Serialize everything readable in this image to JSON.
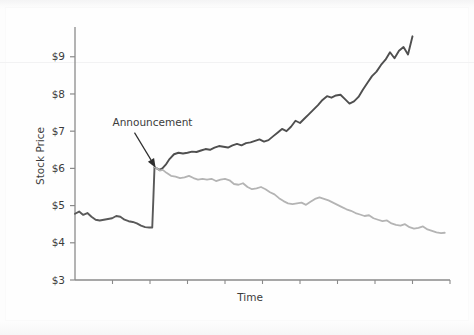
{
  "chart_data": {
    "type": "line",
    "title": "",
    "xlabel": "Time",
    "ylabel": "Stock Price",
    "ylim": [
      3,
      9.8
    ],
    "yticks": [
      3,
      4,
      5,
      6,
      7,
      8,
      9
    ],
    "ytick_labels": [
      "$3",
      "$4",
      "$5",
      "$6",
      "$7",
      "$8",
      "$9"
    ],
    "xlim": [
      0,
      100
    ],
    "xticks": [
      0,
      10,
      20,
      30,
      40,
      50,
      60,
      70,
      80,
      90,
      100
    ],
    "xtick_labels": [
      "",
      "",
      "",
      "",
      "",
      "",
      "",
      "",
      "",
      "",
      ""
    ],
    "grid": false,
    "legend": "none",
    "annotations": [
      {
        "label": "Announcement",
        "text_x": 10.0,
        "text_y": 7.15,
        "point_x": 21.5,
        "point_y": 6.02
      }
    ],
    "series": [
      {
        "name": "pre-announcement",
        "color": "#595959",
        "width": 1.9,
        "x": [
          0.0,
          1.1,
          2.2,
          3.3,
          4.4,
          5.5,
          6.6,
          7.7,
          8.8,
          9.9,
          11.0,
          12.1,
          13.2,
          14.3,
          15.4,
          16.5,
          17.6,
          18.7,
          19.8,
          20.6,
          20.9,
          21.2
        ],
        "y": [
          4.78,
          4.84,
          4.75,
          4.8,
          4.7,
          4.62,
          4.6,
          4.62,
          4.64,
          4.66,
          4.72,
          4.7,
          4.62,
          4.58,
          4.56,
          4.52,
          4.46,
          4.42,
          4.41,
          4.41,
          5.2,
          6.03
        ]
      },
      {
        "name": "upward-post-announcement",
        "color": "#4f4f4f",
        "width": 1.9,
        "x": [
          21.2,
          21.8,
          22.5,
          23.3,
          24.2,
          25.2,
          26.4,
          27.6,
          28.8,
          30.0,
          31.2,
          32.4,
          33.6,
          34.8,
          36.0,
          37.2,
          38.4,
          39.6,
          40.8,
          42.0,
          43.2,
          44.4,
          45.6,
          46.8,
          48.0,
          49.2,
          50.4,
          51.6,
          52.8,
          54.0,
          55.2,
          56.4,
          57.6,
          58.8,
          60.0,
          61.2,
          62.4,
          63.6,
          64.8,
          66.0,
          67.2,
          68.4,
          69.6,
          70.8,
          72.0,
          73.2,
          74.4,
          75.6,
          76.8,
          78.0,
          79.2,
          80.4,
          81.6,
          82.8,
          84.0,
          85.2,
          86.4,
          87.6,
          88.8,
          90.0
        ],
        "y": [
          6.03,
          6.0,
          5.96,
          6.0,
          6.1,
          6.25,
          6.38,
          6.42,
          6.4,
          6.42,
          6.45,
          6.44,
          6.48,
          6.52,
          6.5,
          6.56,
          6.6,
          6.58,
          6.56,
          6.62,
          6.66,
          6.62,
          6.68,
          6.7,
          6.74,
          6.78,
          6.72,
          6.76,
          6.86,
          6.96,
          7.06,
          7.0,
          7.12,
          7.28,
          7.22,
          7.34,
          7.46,
          7.58,
          7.7,
          7.84,
          7.94,
          7.9,
          7.96,
          7.98,
          7.86,
          7.74,
          7.8,
          7.92,
          8.12,
          8.3,
          8.48,
          8.6,
          8.78,
          8.92,
          9.12,
          8.96,
          9.16,
          9.26,
          9.06,
          9.55
        ]
      },
      {
        "name": "downward-post-announcement",
        "color": "#b4b4b4",
        "width": 1.8,
        "x": [
          21.2,
          21.9,
          22.6,
          23.4,
          24.4,
          25.6,
          26.8,
          28.0,
          29.2,
          30.4,
          31.6,
          32.8,
          34.0,
          35.2,
          36.4,
          37.6,
          38.8,
          40.0,
          41.2,
          42.4,
          43.6,
          44.8,
          46.0,
          47.2,
          48.4,
          49.6,
          50.8,
          52.0,
          53.2,
          54.4,
          55.6,
          56.8,
          58.0,
          59.2,
          60.4,
          61.6,
          62.8,
          64.0,
          65.2,
          66.4,
          67.6,
          68.8,
          70.0,
          71.2,
          72.4,
          73.6,
          74.8,
          76.0,
          77.2,
          78.4,
          79.6,
          80.8,
          82.0,
          83.2,
          84.4,
          85.6,
          86.8,
          88.0,
          89.2,
          90.4,
          91.6,
          92.8,
          94.0,
          95.2,
          96.4,
          97.6,
          98.6
        ],
        "y": [
          6.03,
          6.0,
          5.94,
          5.96,
          5.88,
          5.8,
          5.78,
          5.74,
          5.76,
          5.8,
          5.74,
          5.7,
          5.72,
          5.7,
          5.72,
          5.66,
          5.7,
          5.72,
          5.68,
          5.58,
          5.56,
          5.6,
          5.5,
          5.44,
          5.46,
          5.5,
          5.44,
          5.36,
          5.3,
          5.2,
          5.12,
          5.06,
          5.04,
          5.06,
          5.08,
          5.02,
          5.1,
          5.18,
          5.22,
          5.18,
          5.14,
          5.08,
          5.02,
          4.96,
          4.9,
          4.86,
          4.8,
          4.76,
          4.72,
          4.74,
          4.66,
          4.62,
          4.58,
          4.6,
          4.52,
          4.48,
          4.46,
          4.5,
          4.42,
          4.38,
          4.4,
          4.44,
          4.36,
          4.32,
          4.28,
          4.26,
          4.27
        ]
      }
    ]
  },
  "axes": {
    "y_label": "Stock Price",
    "x_label": "Time",
    "tick_labels": [
      "$9",
      "$8",
      "$7",
      "$6",
      "$5",
      "$4",
      "$3"
    ],
    "axis_color": "#8a8a8a"
  },
  "annotation": {
    "label": "Announcement"
  }
}
